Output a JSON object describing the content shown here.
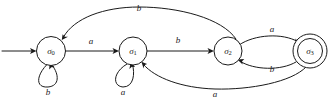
{
  "diagram": {
    "kind": "finite-state-automaton",
    "title": "",
    "canvas": {
      "width": 335,
      "height": 102
    },
    "alphabet": [
      "a",
      "b"
    ],
    "stroke_color": "#1a1a1a",
    "background_color": "#ffffff",
    "start_state": "sigma0",
    "accepting_states": [
      "sigma3"
    ],
    "states": [
      {
        "id": "sigma0",
        "label_base": "σ",
        "label_sub": "0",
        "cx": 51,
        "cy": 51,
        "r": 14.5,
        "accepting": false,
        "is_start": true
      },
      {
        "id": "sigma1",
        "label_base": "σ",
        "label_sub": "1",
        "cx": 133,
        "cy": 51,
        "r": 14,
        "accepting": false,
        "is_start": false
      },
      {
        "id": "sigma2",
        "label_base": "σ",
        "label_sub": "2",
        "cx": 228,
        "cy": 51,
        "r": 14,
        "accepting": false,
        "is_start": false
      },
      {
        "id": "sigma3",
        "label_base": "σ",
        "label_sub": "3",
        "cx": 310,
        "cy": 51,
        "r": 17,
        "r_inner": 12.5,
        "accepting": true,
        "is_start": false
      }
    ],
    "start_arrow": {
      "name": "start-arrow",
      "from_x": 2,
      "to_x": 36,
      "y": 51
    },
    "transitions": [
      {
        "id": "t0",
        "from": "sigma0",
        "to": "sigma1",
        "symbol": "a",
        "shape": "straight",
        "label_x": 91,
        "label_y": 42
      },
      {
        "id": "t1",
        "from": "sigma0",
        "to": "sigma0",
        "symbol": "b",
        "shape": "self-loop-below",
        "label_x": 48,
        "label_y": 93
      },
      {
        "id": "t2",
        "from": "sigma1",
        "to": "sigma2",
        "symbol": "b",
        "shape": "straight",
        "label_x": 178,
        "label_y": 41
      },
      {
        "id": "t3",
        "from": "sigma1",
        "to": "sigma1",
        "symbol": "a",
        "shape": "self-loop-below",
        "label_x": 123,
        "label_y": 93
      },
      {
        "id": "t4",
        "from": "sigma2",
        "to": "sigma3",
        "symbol": "a",
        "shape": "arc-above",
        "label_x": 272,
        "label_y": 30
      },
      {
        "id": "t5",
        "from": "sigma3",
        "to": "sigma2",
        "symbol": "b",
        "shape": "arc-below",
        "label_x": 272,
        "label_y": 70
      },
      {
        "id": "t6",
        "from": "sigma2",
        "to": "sigma0",
        "symbol": "b",
        "shape": "long-arc-above",
        "label_x": 139,
        "label_y": 9
      },
      {
        "id": "t7",
        "from": "sigma3",
        "to": "sigma1",
        "symbol": "a",
        "shape": "long-arc-below",
        "label_x": 215,
        "label_y": 95
      }
    ]
  }
}
